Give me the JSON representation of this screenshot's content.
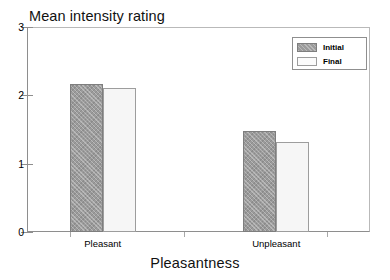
{
  "chart_data": {
    "type": "bar",
    "title": "Mean intensity rating",
    "xlabel": "Pleasantness",
    "ylabel": "",
    "categories": [
      "Pleasant",
      "Unpleasant"
    ],
    "series": [
      {
        "name": "Initial",
        "values": [
          2.16,
          1.48
        ],
        "color": "#9b9b9b"
      },
      {
        "name": "Final",
        "values": [
          2.11,
          1.32
        ],
        "color": "#f6f6f6"
      }
    ],
    "ylim": [
      0,
      3
    ],
    "yticks": [
      0,
      1,
      2,
      3
    ],
    "ytick_labels": [
      "0",
      "1",
      "2",
      "3"
    ],
    "grid": false,
    "legend_position": "top-right",
    "legend_entries": [
      "Initial",
      "Final"
    ]
  },
  "axis": {
    "y_labels": [
      "3",
      "2",
      "1",
      "0"
    ],
    "x_labels": [
      "Pleasant",
      "Unpleasant"
    ],
    "x_title": "Pleasantness"
  },
  "legend": {
    "entries": [
      {
        "label": "Initial"
      },
      {
        "label": "Final"
      }
    ]
  }
}
